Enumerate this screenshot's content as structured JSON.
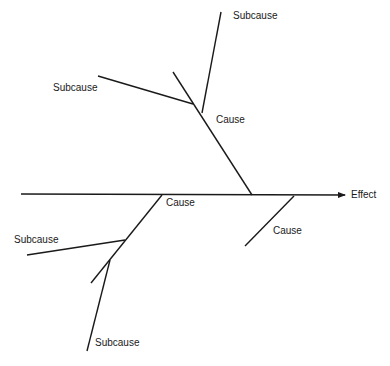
{
  "diagram": {
    "type": "fishbone (cause-and-effect)",
    "effect_label": "Effect",
    "labels": {
      "top_subcause": "Subcause",
      "upper_left_subcause": "Subcause",
      "upper_cause": "Cause",
      "lower_left_cause": "Cause",
      "lower_right_cause": "Cause",
      "lower_left_subcause": "Subcause",
      "bottom_subcause": "Subcause"
    },
    "line_color": "#1a1a1a",
    "background": "#ffffff"
  }
}
